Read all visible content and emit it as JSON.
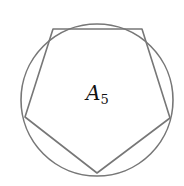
{
  "diagram": {
    "title": "",
    "label": {
      "main": "A",
      "subscript": "5"
    },
    "circle": {
      "cx": 97,
      "cy": 100,
      "r": 76,
      "stroke": "#777777"
    },
    "polygon": {
      "sides": 5,
      "points": "53,29 142,29 170,118 97,173 25,117",
      "stroke": "#777777"
    }
  }
}
